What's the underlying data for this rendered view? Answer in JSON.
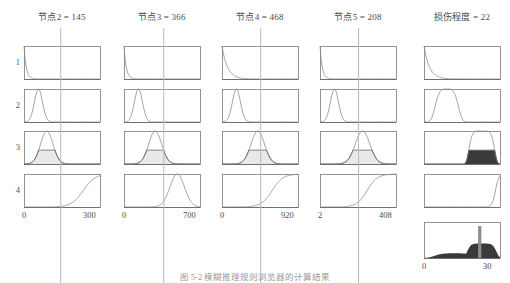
{
  "figure": {
    "type": "fuzzy-inference-rule-viewer",
    "caption": "图 5-2  模糊推理规则浏览器的计算结果",
    "bg_color": "#ffffff",
    "axis_color": "#7a7a7a",
    "curve_color": "#8c8c8c",
    "indicator_color": "#b9b9c4",
    "fill_light": "#e9e9e9",
    "fill_dark": "#3a3a3a"
  },
  "columns": [
    {
      "name": "node2",
      "header": "节点2 = 145",
      "value": 145,
      "axis_min": "0",
      "axis_max": "300",
      "min": 0,
      "max": 300,
      "is_output": false,
      "indicator": 145
    },
    {
      "name": "node3",
      "header": "节点3 = 366",
      "value": 366,
      "axis_min": "0",
      "axis_max": "700",
      "min": 0,
      "max": 700,
      "is_output": false,
      "indicator": 366
    },
    {
      "name": "node4",
      "header": "节点4 = 468",
      "value": 468,
      "axis_min": "0",
      "axis_max": "920",
      "min": 0,
      "max": 920,
      "is_output": false,
      "indicator": 468
    },
    {
      "name": "node5",
      "header": "节点5 = 208",
      "value": 208,
      "axis_min": "2",
      "axis_max": "408",
      "min": 2,
      "max": 408,
      "is_output": false,
      "indicator": 208
    },
    {
      "name": "damage-degree",
      "header": "损伤程度 = 22",
      "value": 22,
      "axis_min": "0",
      "axis_max": "30",
      "min": 0,
      "max": 30,
      "is_output": true,
      "indicator": 22
    }
  ],
  "rules": [
    {
      "label": "1"
    },
    {
      "label": "2"
    },
    {
      "label": "3"
    },
    {
      "label": "4"
    }
  ],
  "aggregate": {
    "name": "aggregated-output",
    "defuzzified": 22
  },
  "chart_data": {
    "type": "line",
    "title": "模糊推理规则浏览器",
    "xlabel": "",
    "ylabel": "",
    "grid": false,
    "legend": "none",
    "inputs": [
      {
        "variable": "节点2",
        "crisp_value": 145,
        "range": [
          0,
          300
        ]
      },
      {
        "variable": "节点3",
        "crisp_value": 366,
        "range": [
          0,
          700
        ]
      },
      {
        "variable": "节点4",
        "crisp_value": 468,
        "range": [
          0,
          920
        ]
      },
      {
        "variable": "节点5",
        "crisp_value": 208,
        "range": [
          2,
          408
        ]
      }
    ],
    "output": {
      "variable": "损伤程度",
      "crisp_value": 22,
      "range": [
        0,
        30
      ]
    },
    "rule_rows": [
      {
        "rule": 1,
        "membership_shapes": [
          "decay",
          "decay",
          "decay",
          "decay"
        ],
        "firing_strength": 0.02,
        "output_shape": "decay"
      },
      {
        "rule": 2,
        "membership_shapes": [
          "gauss",
          "gauss",
          "gauss",
          "gauss"
        ],
        "firing_strength": 0.03,
        "output_shape": "gauss-wide"
      },
      {
        "rule": 3,
        "membership_shapes": [
          "gauss",
          "gauss",
          "gauss",
          "gauss"
        ],
        "firing_strength": 0.42,
        "output_shape": "gauss-clipped-filled"
      },
      {
        "rule": 4,
        "membership_shapes": [
          "sigmoid",
          "gauss-right",
          "sigmoid",
          "sigmoid"
        ],
        "firing_strength": 0.05,
        "output_shape": "sigmoid-steep"
      }
    ]
  }
}
